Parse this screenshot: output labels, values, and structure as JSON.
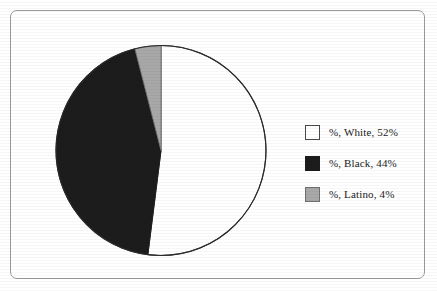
{
  "chart_data": {
    "type": "pie",
    "title": "",
    "categories": [
      "%, White",
      "%, Black",
      "%, Latino"
    ],
    "values": [
      52,
      44,
      4
    ],
    "labels": [
      "%, White, 52%",
      "%, Black, 44%",
      "%, Latino, 4%"
    ],
    "units": "percent",
    "start_angle_deg": 0,
    "direction": "clockwise",
    "legend_position": "right",
    "grid": false,
    "slices": [
      {
        "name": "%, White",
        "value": 52,
        "display": "%, White, 52%",
        "color": "#ffffff",
        "stroke": "#2a2a2a"
      },
      {
        "name": "%, Black",
        "value": 44,
        "display": "%, Black, 44%",
        "color": "#1c1c1c",
        "stroke": "#1c1c1c"
      },
      {
        "name": "%, Latino",
        "value": 4,
        "display": "%, Latino, 4%",
        "color": "#a8a8a8",
        "stroke": "#6f6f6f"
      }
    ]
  },
  "legend": {
    "items": [
      {
        "label": "%, White, 52%",
        "swatch_color": "#ffffff",
        "swatch_border": "#4a4a4a"
      },
      {
        "label": "%, Black, 44%",
        "swatch_color": "#1c1c1c",
        "swatch_border": "#1c1c1c"
      },
      {
        "label": "%, Latino, 4%",
        "swatch_color": "#a8a8a8",
        "swatch_border": "#6f6f6f"
      }
    ]
  },
  "frame": {
    "border_color": "#9a9a9a",
    "background": "#ffffff"
  }
}
